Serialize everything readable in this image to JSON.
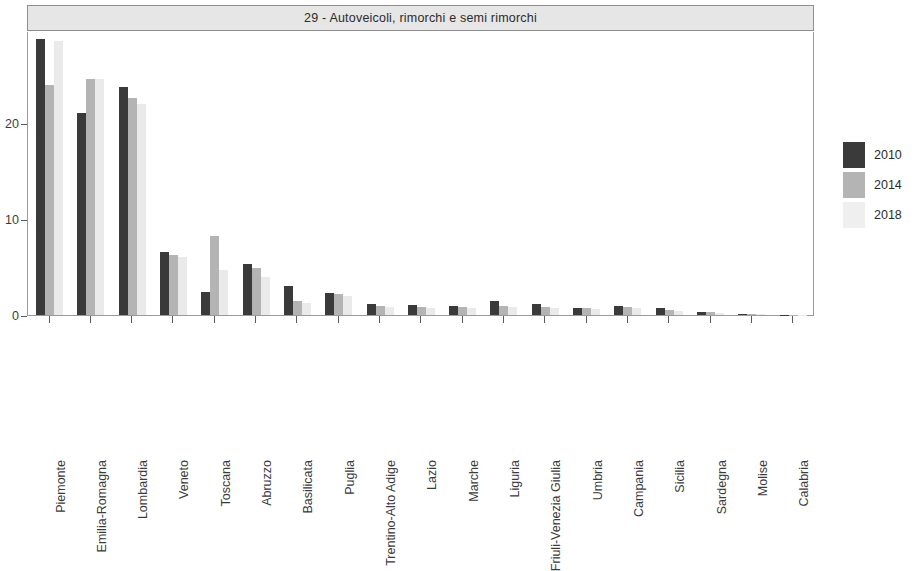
{
  "chart_data": {
    "type": "bar",
    "title": "29 - Autoveicoli, rimorchi e semi rimorchi",
    "xlabel": "",
    "ylabel": "",
    "ylim": [
      0,
      29.5
    ],
    "yticks": [
      0,
      10,
      20
    ],
    "ytick_labels": [
      "0",
      "10",
      "20"
    ],
    "grid": false,
    "legend_position": "right",
    "categories": [
      "Piemonte",
      "Emilia-Romagna",
      "Lombardia",
      "Veneto",
      "Toscana",
      "Abruzzo",
      "Basilicata",
      "Puglia",
      "Trentino-Alto Adige",
      "Lazio",
      "Marche",
      "Liguria",
      "Friuli-Venezia Giulia",
      "Umbria",
      "Campania",
      "Sicilia",
      "Sardegna",
      "Molise",
      "Calabria"
    ],
    "series": [
      {
        "name": "2010",
        "color": "#3a3a3a",
        "values": [
          28.8,
          21.1,
          23.8,
          6.6,
          2.4,
          5.3,
          3.0,
          2.3,
          1.1,
          1.0,
          0.9,
          1.5,
          1.2,
          0.7,
          0.9,
          0.7,
          0.35,
          0.15,
          0.05
        ]
      },
      {
        "name": "2014",
        "color": "#b4b4b4",
        "values": [
          24.0,
          24.6,
          22.6,
          6.3,
          8.2,
          4.9,
          1.5,
          2.2,
          0.9,
          0.8,
          0.8,
          0.9,
          0.8,
          0.7,
          0.8,
          0.5,
          0.3,
          0.1,
          0.03
        ]
      },
      {
        "name": "2018",
        "color": "#eaeaea",
        "values": [
          28.6,
          24.6,
          22.0,
          6.0,
          4.7,
          4.0,
          1.3,
          2.0,
          0.8,
          0.7,
          0.7,
          0.8,
          0.7,
          0.6,
          0.7,
          0.4,
          0.25,
          0.08,
          0.02
        ]
      }
    ]
  },
  "legend": {
    "items": [
      {
        "label": "2010"
      },
      {
        "label": "2014"
      },
      {
        "label": "2018"
      }
    ]
  }
}
